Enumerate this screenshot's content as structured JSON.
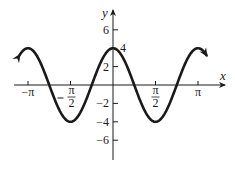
{
  "chart_data": {
    "type": "line",
    "title": "",
    "function": "y = 4cos(2x)",
    "xlabel": "x",
    "ylabel": "y",
    "xlim": [
      -3.456,
      3.456
    ],
    "ylim": [
      -8,
      8
    ],
    "x_ticks": [
      {
        "value": -3.14159,
        "label": "−π"
      },
      {
        "value": -1.5708,
        "label": "−π/2",
        "num": "π",
        "den": "2",
        "neg": true
      },
      {
        "value": 1.5708,
        "label": "π/2",
        "num": "π",
        "den": "2",
        "neg": false
      },
      {
        "value": 3.14159,
        "label": "π"
      }
    ],
    "y_ticks": [
      {
        "value": 6,
        "label": "6"
      },
      {
        "value": 2,
        "label": "2"
      },
      {
        "value": -2,
        "label": "−2"
      },
      {
        "value": -4,
        "label": "−4"
      },
      {
        "value": -6,
        "label": "−6"
      }
    ],
    "annotations": [
      {
        "x": 0,
        "y": 4,
        "label": "4"
      }
    ],
    "series": [
      {
        "name": "4cos(2x)",
        "amplitude": 4,
        "frequency": 2,
        "x_start": -3.456,
        "x_end": 3.456,
        "arrows": "both",
        "key_points": [
          {
            "x": -3.14159,
            "y": 4
          },
          {
            "x": -2.356,
            "y": 0
          },
          {
            "x": -1.5708,
            "y": -4
          },
          {
            "x": -0.785,
            "y": 0
          },
          {
            "x": 0,
            "y": 4
          },
          {
            "x": 0.785,
            "y": 0
          },
          {
            "x": 1.5708,
            "y": -4
          },
          {
            "x": 2.356,
            "y": 0
          },
          {
            "x": 3.14159,
            "y": 4
          }
        ]
      }
    ],
    "grid": false,
    "legend": null
  },
  "colors": {
    "curve": "#1a1a1a",
    "axis": "#1a1a1a",
    "background": "#ffffff"
  }
}
